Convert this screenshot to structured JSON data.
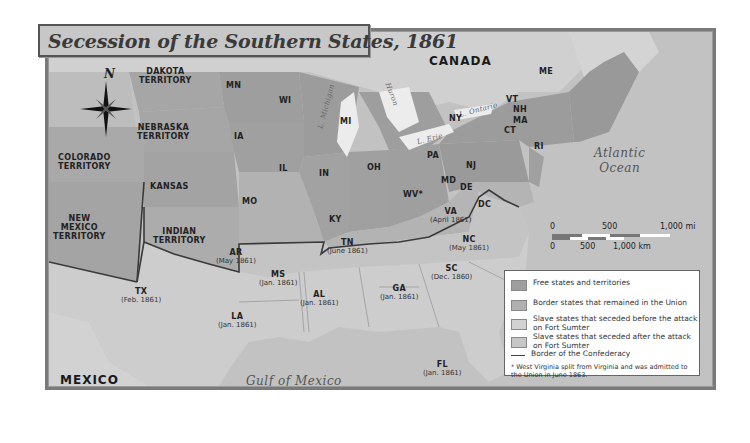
{
  "title": "Secession of the Southern States, 1861",
  "colors": {
    "free": "#9e9e9e",
    "border_states": "#b0b0b0",
    "seceded_before": "#d2d2d2",
    "seceded_after": "#c6c6c6",
    "territory": "#a8a8a8",
    "water": "#c4c4c4",
    "foreign_land": "#cfcfcf",
    "lake": "#ececec",
    "confederacy_border": "#3a3a3a"
  },
  "compass": {
    "label": "N"
  },
  "regions": {
    "canada": "CANADA",
    "mexico": "MEXICO",
    "atlantic_line1": "Atlantic",
    "atlantic_line2": "Ocean",
    "gulf": "Gulf of Mexico"
  },
  "lakes": {
    "michigan": "L. Michigan",
    "huron": "Huron",
    "erie": "L. Erie",
    "ontario": "L. Ontario"
  },
  "territories": {
    "dakota": [
      "DAKOTA",
      "TERRITORY"
    ],
    "nebraska": [
      "NEBRASKA",
      "TERRITORY"
    ],
    "colorado": [
      "COLORADO",
      "TERRITORY"
    ],
    "new_mexico": [
      "NEW",
      "MEXICO",
      "TERRITORY"
    ],
    "indian": [
      "INDIAN",
      "TERRITORY"
    ],
    "kansas": "KANSAS"
  },
  "states": {
    "MN": "MN",
    "WI": "WI",
    "MI": "MI",
    "IA": "IA",
    "IL": "IL",
    "IN": "IN",
    "OH": "OH",
    "MO": "MO",
    "KY": "KY",
    "WV": "WV*",
    "PA": "PA",
    "NY": "NY",
    "NJ": "NJ",
    "MD": "MD",
    "DE": "DE",
    "DC": "DC",
    "ME": "ME",
    "VT": "VT",
    "NH": "NH",
    "MA": "MA",
    "CT": "CT",
    "RI": "RI"
  },
  "seceded": {
    "VA": {
      "abbr": "VA",
      "date": "(April 1861)"
    },
    "NC": {
      "abbr": "NC",
      "date": "(May 1861)"
    },
    "TN": {
      "abbr": "TN",
      "date": "(June 1861)"
    },
    "AR": {
      "abbr": "AR",
      "date": "(May 1861)"
    },
    "SC": {
      "abbr": "SC",
      "date": "(Dec. 1860)"
    },
    "MS": {
      "abbr": "MS",
      "date": "(Jan. 1861)"
    },
    "AL": {
      "abbr": "AL",
      "date": "(Jan. 1861)"
    },
    "GA": {
      "abbr": "GA",
      "date": "(Jan. 1861)"
    },
    "LA": {
      "abbr": "LA",
      "date": "(Jan. 1861)"
    },
    "TX": {
      "abbr": "TX",
      "date": "(Feb. 1861)"
    },
    "FL": {
      "abbr": "FL",
      "date": "(Jan. 1861)"
    }
  },
  "scale": {
    "mi_0": "0",
    "mi_500": "500",
    "mi_1000": "1,000 mi",
    "km_0": "0",
    "km_500": "500",
    "km_1000": "1,000 km"
  },
  "legend": {
    "items": [
      {
        "label": "Free states and territories"
      },
      {
        "label": "Border states that remained in the Union"
      },
      {
        "label": "Slave states that seceded before the attack on Fort Sumter"
      },
      {
        "label": "Slave states that seceded after the attack on Fort Sumter"
      },
      {
        "label": "Border of the Confederacy"
      }
    ],
    "note": "* West Virginia split from Virginia and was admitted to the Union in June 1863."
  }
}
